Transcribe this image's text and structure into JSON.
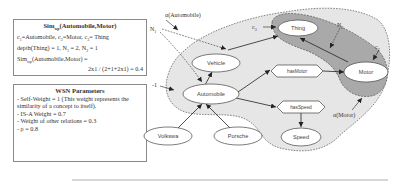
{
  "sim_box": {
    "title_main": "Sim",
    "title_sub": "wp",
    "title_args": "(Automobile,Motor)",
    "line1_parts": [
      "c",
      "1",
      "=Automobile, c",
      "2",
      "=Motor, c",
      "3",
      "= Thing"
    ],
    "line2_parts": [
      "depth(Thing) = 1, N",
      "1",
      " = 2, N",
      "2",
      " = 1"
    ],
    "line3_parts": [
      "Sim",
      "wp",
      "(Automobile,Motor) ="
    ],
    "line4": "2x1 / (2+1+2x1) = 0.4"
  },
  "wsn_box": {
    "title": "WSN Parameters",
    "lines": [
      "- Self-Weight = 1 (This weight represents the similarity of  a concept to itself).",
      "- IS-A Weight = 0.7",
      "- Weight of other relations  = 0.3",
      "- ρ = 0.8"
    ]
  },
  "diagram": {
    "regions": {
      "alpha_automobile_label": "α(Automobile)",
      "alpha_motor_label": "α(Motor)"
    },
    "annotations": {
      "n1": "N",
      "n1_sub": "1",
      "n2": "N",
      "n2_sub": "2",
      "c3": "c",
      "c3_sub": "3",
      "c2": "c",
      "c2_sub": "2",
      "minus_one": "-1"
    },
    "nodes": {
      "thing": "Thing",
      "vehicle": "Vehicle",
      "automobile": "Automobile",
      "motor": "Motor",
      "speed": "Speed",
      "volkswa": "Volkswa",
      "porsche": "Porsche"
    },
    "relations": {
      "has_motor": "hasMotor",
      "has_speed": "hasSpeed"
    },
    "colors": {
      "outer_region": "#e6e6e6",
      "inner_region": "#a9a9a9",
      "node_fill": "#ffffff",
      "stroke": "#333333"
    }
  }
}
